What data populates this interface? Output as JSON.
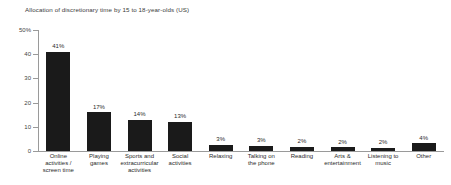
{
  "chart_data": {
    "type": "bar",
    "title": "Allocation of discretionary time by 15 to 18-year-olds (US)",
    "xlabel": "",
    "ylabel": "",
    "ylim": [
      0,
      50
    ],
    "yticks": [
      0,
      10,
      20,
      30,
      40,
      50
    ],
    "ytick_labels": [
      "0",
      "10",
      "20",
      "30",
      "40",
      "50%"
    ],
    "grid": false,
    "legend": null,
    "bar_color": "#1a1a1a",
    "axis_color": "#9a9a9a",
    "categories": [
      "Online activities / screen time",
      "Playing games",
      "Sports and extracurricular activities",
      "Social activities",
      "Relaxing",
      "Talking on the phone",
      "Reading",
      "Arts & entertainment",
      "Listening to music",
      "Other"
    ],
    "category_lines": [
      [
        "Online",
        "activities /",
        "screen time"
      ],
      [
        "Playing",
        "games"
      ],
      [
        "Sports and",
        "extracurricular",
        "activities"
      ],
      [
        "Social",
        "activities"
      ],
      [
        "Relaxing"
      ],
      [
        "Talking on",
        "the phone"
      ],
      [
        "Reading"
      ],
      [
        "Arts &",
        "entertainment"
      ],
      [
        "Listening to",
        "music"
      ],
      [
        "Other"
      ]
    ],
    "values": [
      41,
      17,
      14,
      13,
      3,
      3,
      2,
      2,
      2,
      4
    ],
    "plotted_heights": [
      41,
      16,
      13,
      12,
      2.5,
      2.2,
      1.8,
      1.5,
      1.3,
      3.3
    ],
    "data_labels": [
      "41%",
      "17%",
      "14%",
      "13%",
      "3%",
      "3%",
      "2%",
      "2%",
      "2%",
      "4%"
    ]
  }
}
